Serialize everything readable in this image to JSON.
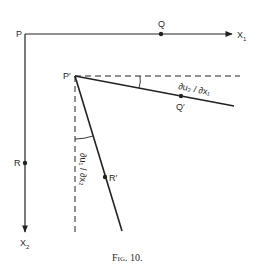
{
  "figure": {
    "caption": "Fig. 10.",
    "colors": {
      "stroke": "#222222",
      "background": "#ffffff"
    }
  },
  "points": {
    "P": "P",
    "Q": "Q",
    "R": "R",
    "P_prime": "P′",
    "Q_prime": "Q′",
    "R_prime": "R′"
  },
  "axes": {
    "x1": "X",
    "x1_sub": "1",
    "x2": "X",
    "x2_sub": "2"
  },
  "angles": {
    "top": "∂u₂ / ∂x₁",
    "left": "∂u₁ / ∂x₂"
  }
}
